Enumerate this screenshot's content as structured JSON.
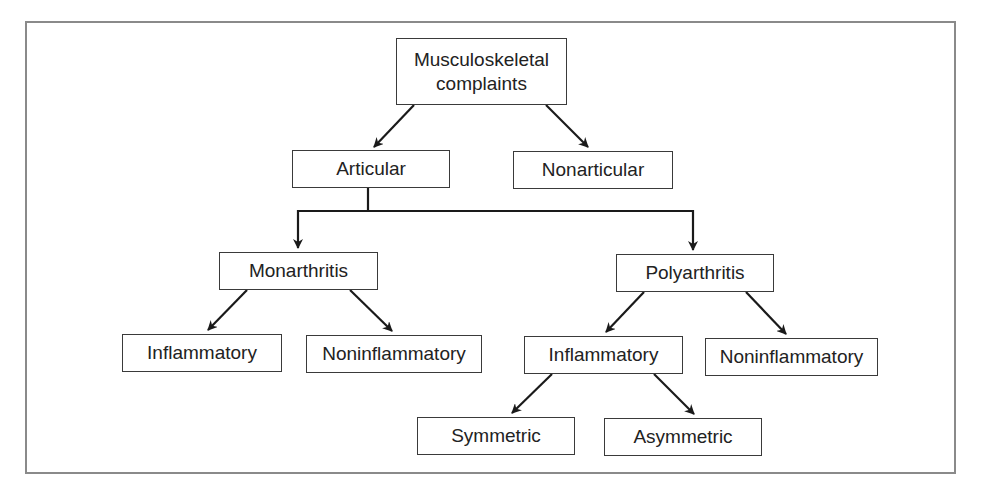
{
  "diagram": {
    "type": "tree",
    "title": "",
    "colors": {
      "frame": "#8a8a8a",
      "box_border": "#3a3a3a",
      "arrow": "#1a1a1a",
      "text": "#222222",
      "background": "#ffffff"
    },
    "nodes": {
      "root": {
        "label_line1": "Musculoskeletal",
        "label_line2": "complaints"
      },
      "articular": {
        "label": "Articular"
      },
      "nonarticular": {
        "label": "Nonarticular"
      },
      "monarthritis": {
        "label": "Monarthritis"
      },
      "polyarthritis": {
        "label": "Polyarthritis"
      },
      "mono_inflammatory": {
        "label": "Inflammatory"
      },
      "mono_noninflammatory": {
        "label": "Noninflammatory"
      },
      "poly_inflammatory": {
        "label": "Inflammatory"
      },
      "poly_noninflammatory": {
        "label": "Noninflammatory"
      },
      "symmetric": {
        "label": "Symmetric"
      },
      "asymmetric": {
        "label": "Asymmetric"
      }
    },
    "edges": [
      {
        "from": "root",
        "to": "articular"
      },
      {
        "from": "root",
        "to": "nonarticular"
      },
      {
        "from": "articular",
        "to": "monarthritis"
      },
      {
        "from": "articular",
        "to": "polyarthritis"
      },
      {
        "from": "monarthritis",
        "to": "mono_inflammatory"
      },
      {
        "from": "monarthritis",
        "to": "mono_noninflammatory"
      },
      {
        "from": "polyarthritis",
        "to": "poly_inflammatory"
      },
      {
        "from": "polyarthritis",
        "to": "poly_noninflammatory"
      },
      {
        "from": "poly_inflammatory",
        "to": "symmetric"
      },
      {
        "from": "poly_inflammatory",
        "to": "asymmetric"
      }
    ]
  }
}
